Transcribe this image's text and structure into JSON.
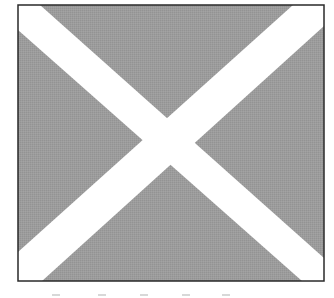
{
  "figure": {
    "colors": {
      "field": "#9a9a9a",
      "cross": "#ffffff",
      "border": "#2a2a2a",
      "background": "#ffffff"
    },
    "frame": {
      "x": 18,
      "y": 5,
      "width": 306,
      "height": 276
    },
    "cross_band_width": 34
  }
}
